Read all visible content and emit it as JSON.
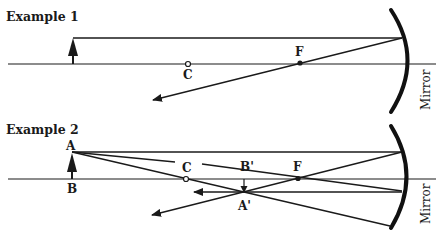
{
  "examples": [
    {
      "title": "Example 1",
      "labels": {
        "center": "C",
        "focus": "F",
        "mirror": "Mirror"
      }
    },
    {
      "title": "Example 2",
      "labels": {
        "object_top": "A",
        "object_base": "B",
        "center": "C",
        "focus": "F",
        "image_base": "B'",
        "image_top": "A'",
        "mirror": "Mirror"
      }
    }
  ],
  "colors": {
    "ink": "#1a1a1a",
    "background": "#ffffff"
  }
}
